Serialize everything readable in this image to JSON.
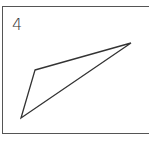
{
  "figure": {
    "label": "4",
    "shape": "triangle",
    "vertices": [
      [
        35,
        70
      ],
      [
        131,
        43
      ],
      [
        21,
        118
      ]
    ],
    "stroke_color": "#333333"
  }
}
